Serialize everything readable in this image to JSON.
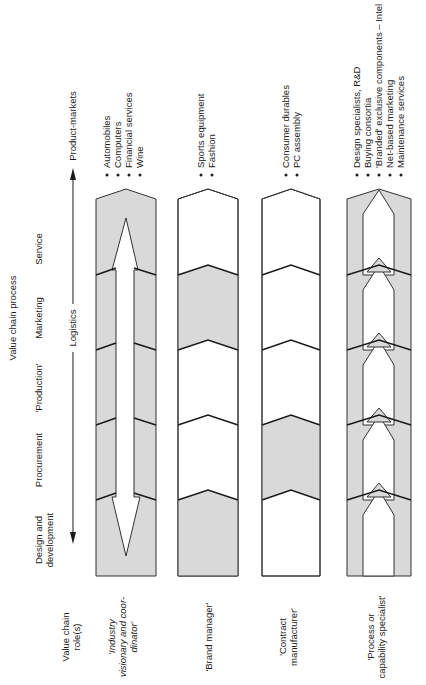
{
  "diagram": {
    "header_title": "Value chain process",
    "stages": [
      {
        "label": "Service"
      },
      {
        "label": "Marketing"
      },
      {
        "label": "'Production'"
      },
      {
        "label": "Procurement"
      },
      {
        "label_line1": "Design and",
        "label_line2": "development"
      }
    ],
    "axis": {
      "label": "Logistics",
      "top_label": "Product-markets"
    },
    "roles_header": {
      "line1": "Value chain",
      "line2": "role(s)"
    },
    "colors": {
      "shaded": "#d9d9d9",
      "line": "#1a1a1a",
      "background": "#ffffff"
    },
    "columns": [
      {
        "role_line1": "'Industry",
        "role_line2": "visionary and coor-",
        "role_line3": "dinator'",
        "shaded_segments": [
          "all"
        ],
        "products": [
          "Automobiles",
          "Computers",
          "Financial services",
          "Wine"
        ]
      },
      {
        "role_line1": "'Brand manager'",
        "shaded_segments": [
          "Design and development",
          "Marketing"
        ],
        "products": [
          "Sports equipment",
          "Fashion"
        ]
      },
      {
        "role_line1": "'Contract",
        "role_line2": "manufacturer'",
        "shaded_segments": [
          "'Production'"
        ],
        "products": [
          "Consumer durables",
          "PC assembly"
        ]
      },
      {
        "role_line1": "'Process or",
        "role_line2": "capability specialist'",
        "shaded_segments": [
          "outer bands"
        ],
        "products": [
          "Design specialists, R&D",
          "Buying consortia",
          "'Branded' exclusive components – Intel",
          "Net-based marketing",
          "Maintenance services"
        ]
      }
    ]
  }
}
